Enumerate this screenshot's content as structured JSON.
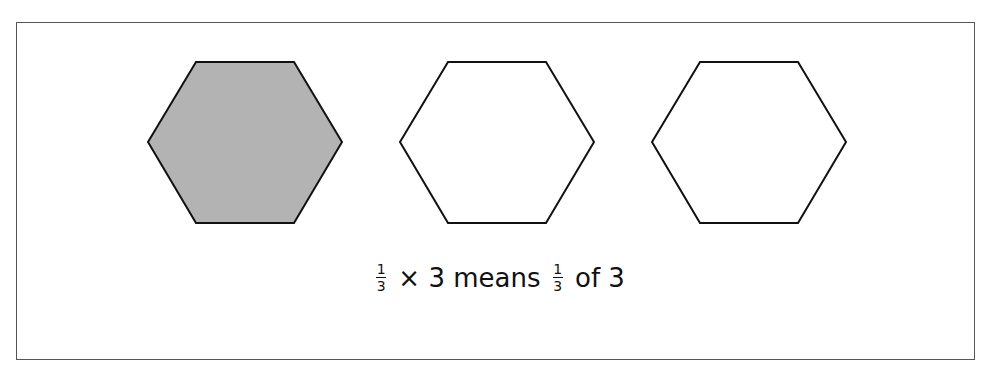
{
  "diagram": {
    "hexagons": [
      {
        "id": 1,
        "shaded": true,
        "fill": "#b3b3b3"
      },
      {
        "id": 2,
        "shaded": false,
        "fill": "#ffffff"
      },
      {
        "id": 3,
        "shaded": false,
        "fill": "#ffffff"
      }
    ],
    "caption": {
      "frac1_num": "1",
      "frac1_den": "3",
      "part1": " × 3 means ",
      "frac2_num": "1",
      "frac2_den": "3",
      "part2": " of 3"
    },
    "colors": {
      "stroke": "#111111",
      "shaded": "#b3b3b3",
      "border": "#555555"
    }
  }
}
